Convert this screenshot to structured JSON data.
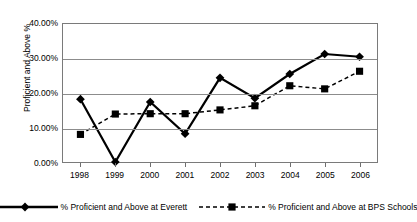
{
  "chart_data": {
    "type": "line",
    "title": "",
    "xlabel": "",
    "ylabel": "Proficient and Above %",
    "categories": [
      "1998",
      "1999",
      "2000",
      "2001",
      "2002",
      "2003",
      "2004",
      "2005",
      "2006"
    ],
    "ylim": [
      0,
      40
    ],
    "y_ticks": [
      "0.00%",
      "10.00%",
      "20.00%",
      "30.00%",
      "40.00%"
    ],
    "y_tick_values": [
      0,
      10,
      20,
      30,
      40
    ],
    "grid": true,
    "legend_position": "bottom",
    "series": [
      {
        "name": "% Proficient and Above at Everett",
        "marker": "diamond",
        "line_style": "solid",
        "color": "#000000",
        "values": [
          18.2,
          0.0,
          17.4,
          8.2,
          24.4,
          18.5,
          25.5,
          31.3,
          30.5
        ]
      },
      {
        "name": "% Proficient and Above at BPS Schools",
        "marker": "square",
        "line_style": "dashed",
        "color": "#000000",
        "values": [
          8.0,
          13.9,
          14.0,
          14.0,
          15.1,
          16.3,
          22.1,
          21.2,
          26.3
        ]
      }
    ]
  },
  "legend": {
    "entries": [
      {
        "label": "% Proficient and Above at Everett"
      },
      {
        "label": "% Proficient and Above at BPS Schools"
      }
    ]
  }
}
